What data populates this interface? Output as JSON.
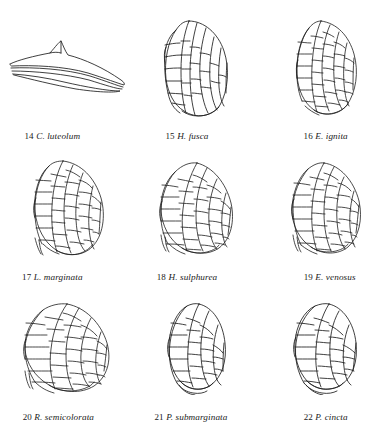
{
  "plate": {
    "background_color": "#ffffff",
    "ink_color": "#1a1a1a",
    "figure_count": 9,
    "grid": "3x3",
    "figures": [
      {
        "number": "14",
        "name": "C. luteolum",
        "shape": "narrow-elongate-wing",
        "venation": "sparse",
        "art_width": 142,
        "art_height": 62
      },
      {
        "number": "15",
        "name": "H. fusca",
        "shape": "oval-wing",
        "venation": "longitudinal",
        "art_width": 78,
        "art_height": 100
      },
      {
        "number": "16",
        "name": "E. ignita",
        "shape": "oval-wing",
        "venation": "cross-veined",
        "art_width": 76,
        "art_height": 98
      },
      {
        "number": "17",
        "name": "L. marginata",
        "shape": "broad-oval-wing",
        "venation": "dense-reticulate",
        "art_width": 88,
        "art_height": 98
      },
      {
        "number": "18",
        "name": "H. sulphurea",
        "shape": "broad-oval-wing",
        "venation": "dense-reticulate",
        "art_width": 90,
        "art_height": 96
      },
      {
        "number": "19",
        "name": "E. venosus",
        "shape": "broad-oval-wing",
        "venation": "dense-reticulate",
        "art_width": 86,
        "art_height": 96
      },
      {
        "number": "20",
        "name": "R. semicolorata",
        "shape": "large-broad-wing",
        "venation": "dense-reticulate",
        "art_width": 100,
        "art_height": 92
      },
      {
        "number": "21",
        "name": "P. submarginata",
        "shape": "narrow-oval-wing",
        "venation": "cross-veined",
        "art_width": 74,
        "art_height": 92
      },
      {
        "number": "22",
        "name": "P. cincta",
        "shape": "oval-wing",
        "venation": "cross-veined",
        "art_width": 80,
        "art_height": 92
      }
    ]
  }
}
